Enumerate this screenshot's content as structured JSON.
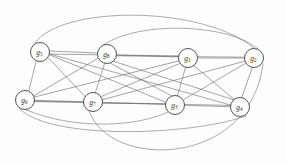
{
  "figure": {
    "background_color": "#fdfdfc",
    "edge_color": "#6d6f70",
    "node_fill": "#fdfdfc",
    "node_stroke": "#4a4c4d",
    "label_color": "#2e2f30",
    "width": 286,
    "height": 164
  },
  "nodes": [
    {
      "id": "g1",
      "base": "g",
      "sub": "1",
      "label": "g1",
      "cx": 188,
      "cy": 58,
      "r": 9.5
    },
    {
      "id": "g2",
      "base": "g",
      "sub": "2",
      "label": "g2",
      "cx": 254,
      "cy": 58,
      "r": 9.5
    },
    {
      "id": "g3",
      "base": "g",
      "sub": "3",
      "label": "g3",
      "cx": 175,
      "cy": 105,
      "r": 9.5
    },
    {
      "id": "g4",
      "base": "g",
      "sub": "4",
      "label": "g4",
      "cx": 240,
      "cy": 107,
      "r": 9.5
    },
    {
      "id": "g5",
      "base": "g",
      "sub": "5",
      "label": "g5",
      "cx": 40,
      "cy": 52,
      "r": 9.5
    },
    {
      "id": "g6",
      "base": "g",
      "sub": "6",
      "label": "g6",
      "cx": 25,
      "cy": 100,
      "r": 9.5
    },
    {
      "id": "g7",
      "base": "g",
      "sub": "7",
      "label": "g7",
      "cx": 93,
      "cy": 102,
      "r": 9.5
    },
    {
      "id": "g8",
      "base": "g",
      "sub": "8",
      "label": "g8",
      "cx": 107,
      "cy": 54,
      "r": 9.5
    }
  ],
  "edges": [
    {
      "id": "e-g5-g8",
      "source": "g5",
      "target": "g8",
      "shape": "line"
    },
    {
      "id": "e-g8-g1",
      "source": "g8",
      "target": "g1",
      "shape": "line"
    },
    {
      "id": "e-g1-g2",
      "source": "g1",
      "target": "g2",
      "shape": "line"
    },
    {
      "id": "e-g5-g6",
      "source": "g5",
      "target": "g6",
      "shape": "line"
    },
    {
      "id": "e-g5-g7",
      "source": "g5",
      "target": "g7",
      "shape": "line"
    },
    {
      "id": "e-g5-g3",
      "source": "g5",
      "target": "g3",
      "shape": "line"
    },
    {
      "id": "e-g5-g4",
      "source": "g5",
      "target": "g4",
      "shape": "line"
    },
    {
      "id": "e-g5-g1",
      "source": "g5",
      "target": "g1",
      "shape": "line"
    },
    {
      "id": "e-g6-g8",
      "source": "g6",
      "target": "g8",
      "shape": "line"
    },
    {
      "id": "e-g6-g7",
      "source": "g6",
      "target": "g7",
      "shape": "line"
    },
    {
      "id": "e-g6-g3",
      "source": "g6",
      "target": "g3",
      "shape": "line"
    },
    {
      "id": "e-g6-g4",
      "source": "g6",
      "target": "g4",
      "shape": "line"
    },
    {
      "id": "e-g6-g1",
      "source": "g6",
      "target": "g1",
      "shape": "line"
    },
    {
      "id": "e-g7-g8",
      "source": "g7",
      "target": "g8",
      "shape": "line"
    },
    {
      "id": "e-g7-g3",
      "source": "g7",
      "target": "g3",
      "shape": "line"
    },
    {
      "id": "e-g7-g1",
      "source": "g7",
      "target": "g1",
      "shape": "line"
    },
    {
      "id": "e-g7-g2",
      "source": "g7",
      "target": "g2",
      "shape": "line"
    },
    {
      "id": "e-g8-g3",
      "source": "g8",
      "target": "g3",
      "shape": "line"
    },
    {
      "id": "e-g8-g4",
      "source": "g8",
      "target": "g4",
      "shape": "line"
    },
    {
      "id": "e-g8-g2",
      "source": "g8",
      "target": "g2",
      "shape": "line"
    },
    {
      "id": "e-g1-g3",
      "source": "g1",
      "target": "g3",
      "shape": "line"
    },
    {
      "id": "e-g1-g4",
      "source": "g1",
      "target": "g4",
      "shape": "line"
    },
    {
      "id": "e-g2-g3",
      "source": "g2",
      "target": "g3",
      "shape": "line"
    },
    {
      "id": "e-g2-g4",
      "source": "g2",
      "target": "g4",
      "shape": "line"
    },
    {
      "id": "e-g3-g4",
      "source": "g3",
      "target": "g4",
      "shape": "line"
    },
    {
      "id": "e-g5-g2-arc",
      "source": "g5",
      "target": "g2",
      "shape": "arc-top"
    },
    {
      "id": "e-g8-g2-arc",
      "source": "g8",
      "target": "g2",
      "shape": "arc-top"
    },
    {
      "id": "e-g6-g4-arc",
      "source": "g6",
      "target": "g4",
      "shape": "arc-bottom"
    },
    {
      "id": "e-g6-g3-arc",
      "source": "g6",
      "target": "g3",
      "shape": "arc-bottom"
    },
    {
      "id": "e-g7-g2-arc",
      "source": "g7",
      "target": "g2",
      "shape": "arc-bottom"
    }
  ],
  "edge_paths": {
    "e-g5-g8": "M 49.5 51 L 97.5 53",
    "e-g8-g1": "M 116.5 55 L 178.5 57",
    "e-g1-g2": "M 197.5 58 L 244.5 58",
    "e-g5-g6": "M 36 61.4 L 29 90.6",
    "e-g5-g7": "M 48.3 57.8 L 84.7 96.2",
    "e-g5-g3": "M 49.2 54.7 L 165.8 102.3",
    "e-g5-g4": "M 49.4 53.9 L 230.6 105.1",
    "e-g5-g1": "M 49.4 54.1 L 178.6 55.9",
    "e-g6-g8": "M 33.7 95.9 L 98.3 58.1",
    "e-g6-g7": "M 34.5 100.3 L 83.5 101.7",
    "e-g6-g3": "M 34.4 101 L 165.6 104",
    "e-g6-g4": "M 34.4 101.6 L 230.6 105.4",
    "e-g6-g1": "M 34.1 97.1 L 178.9 60.9",
    "e-g7-g8": "M 95.3 92.7 L 104.7 63.3",
    "e-g7-g3": "M 102.5 103 L 165.5 104",
    "e-g7-g1": "M 101.8 96.3 L 179.2 63.7",
    "e-g7-g2": "M 102.3 99.8 L 244.7 61.2",
    "e-g8-g3": "M 110.2 63.1 L 171.8 95.9",
    "e-g8-g4": "M 113.2 61.2 L 233.8 99.8",
    "e-g8-g2": "M 116.5 55.8 L 244.5 57.2",
    "e-g1-g3": "M 185.6 67.2 L 177.4 95.8",
    "e-g1-g4": "M 194 65.6 L 234 99.4",
    "e-g2-g3": "M 245.2 63.5 L 183.8 99.5",
    "e-g2-g4": "M 252.3 67.3 L 241.7 97.7",
    "e-g3-g4": "M 184.5 105.3 L 230.5 106.7",
    "e-g5-g2-arc": "M 35 43 C 60 6, 200 4, 254 48",
    "e-g8-g2-arc": "M 103 45 C 140 20, 230 24, 258 49",
    "e-g6-g4-arc": "M 20 109 C 50 140, 190 136, 246 116",
    "e-g6-g3-arc": "M 18 106 C 60 128, 130 130, 168 112",
    "e-g7-g2-arc": "M 89 111 C 110 170, 250 168, 263 64"
  }
}
